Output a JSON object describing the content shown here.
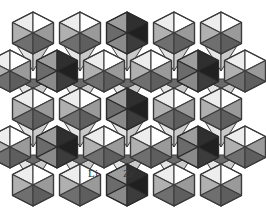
{
  "figure": {
    "kind": "crystal-structure-diagram",
    "background_color": "#ffffff",
    "width": 266,
    "height": 215
  },
  "labels": [
    {
      "id": "li",
      "text": "Li",
      "x": 88,
      "y": 168,
      "color": "#2b2b2b",
      "on_polyhedron": "light"
    },
    {
      "id": "zr",
      "text": "Zr",
      "x": 123,
      "y": 168,
      "color": "#3a3a3a",
      "on_polyhedron": "dark"
    }
  ],
  "palette": {
    "outline": "#3d3d3d",
    "light_top_left": "#f3f3f3",
    "light_top_right": "#ffffff",
    "light_face_white": "#fdfdfd",
    "light_side_gray": "#a8a8a8",
    "light_side_gray_dark": "#8f8f8f",
    "light_bottom": "#6e6e6e",
    "dark_top_left": "#9b9b9b",
    "dark_top_right": "#2e2e2e",
    "dark_left": "#6a6a6a",
    "dark_right": "#1f1f1f",
    "dark_bottom": "#4a4a4a",
    "mid_gray": "#7d7d7d",
    "shadow_gray": "#5a5a5a"
  },
  "lattice": {
    "columns": 5,
    "rows": 5,
    "cell_width": 47,
    "row_height": 37.5,
    "origin_x": 10,
    "origin_y": 12,
    "row_offsets": [
      0,
      -23.5,
      0,
      -23.5,
      0
    ],
    "dark_positions": [
      {
        "row": 0,
        "col": 2
      },
      {
        "row": 1,
        "col": 1
      },
      {
        "row": 1,
        "col": 4
      },
      {
        "row": 2,
        "col": 2
      },
      {
        "row": 3,
        "col": 1
      },
      {
        "row": 3,
        "col": 4
      },
      {
        "row": 4,
        "col": 2
      }
    ]
  },
  "chart_data": {
    "type": "diagram",
    "title": "",
    "legend": [
      "Li",
      "Zr"
    ],
    "series": [
      {
        "name": "Li",
        "description": "light octahedra",
        "count": 18
      },
      {
        "name": "Zr",
        "description": "dark octahedra",
        "count": 7
      }
    ]
  }
}
